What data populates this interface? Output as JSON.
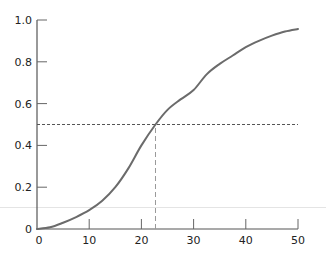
{
  "chart_data": {
    "type": "line",
    "title": "",
    "xlabel": "",
    "ylabel": "",
    "xlim": [
      0,
      50
    ],
    "ylim": [
      0,
      1.0
    ],
    "grid": false,
    "legend": null,
    "x_ticks": [
      0,
      10,
      20,
      30,
      40,
      50
    ],
    "x_tick_labels": [
      "0",
      "10",
      "20",
      "30",
      "40",
      "50"
    ],
    "y_ticks": [
      0,
      0.2,
      0.4,
      0.6,
      0.8,
      1.0
    ],
    "y_tick_labels": [
      "0",
      "0.2",
      "0.4",
      "0.6",
      "0.8",
      "1.0"
    ],
    "series": [
      {
        "name": "curve",
        "color": "#6b6b6b",
        "x": [
          0,
          2.5,
          5,
          7.5,
          10,
          12.5,
          15,
          17.5,
          20,
          22.7,
          25,
          27.5,
          30,
          32.5,
          35,
          37.5,
          40,
          42.5,
          45,
          47.5,
          50
        ],
        "y": [
          0,
          0.008,
          0.03,
          0.057,
          0.09,
          0.135,
          0.2,
          0.29,
          0.4,
          0.5,
          0.57,
          0.62,
          0.665,
          0.74,
          0.79,
          0.83,
          0.87,
          0.9,
          0.925,
          0.945,
          0.957
        ]
      }
    ],
    "annotations": [
      {
        "type": "hline",
        "y": 0.5,
        "x_from": 0,
        "x_to": 50,
        "style": "dashed",
        "color": "#555555"
      },
      {
        "type": "vline",
        "x": 22.7,
        "y_from": 0,
        "y_to": 0.5,
        "style": "dashed",
        "color": "#999999"
      }
    ]
  }
}
